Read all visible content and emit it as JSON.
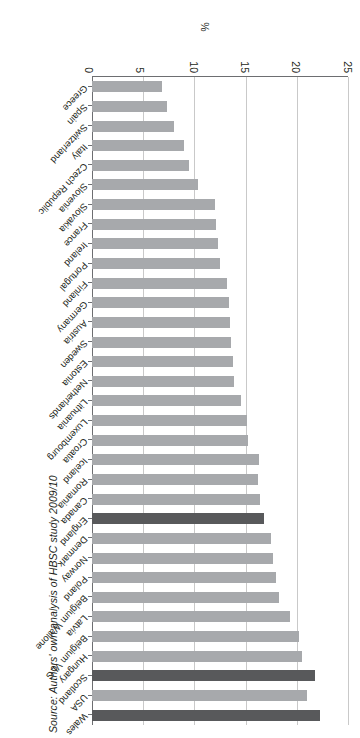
{
  "figure": {
    "source_note": "Source: Authors' own analysis of HBSC study 2009/10",
    "axis_title": "%",
    "rotated_180": true
  },
  "chart_data": {
    "type": "bar",
    "orientation": "horizontal",
    "title": "",
    "xlabel": "%",
    "ylabel": "",
    "xlim": [
      0,
      25
    ],
    "xticks": [
      0,
      5,
      10,
      15,
      20,
      25
    ],
    "grid": true,
    "legend": [],
    "highlight_color": "#58595b",
    "bar_color": "#a7a9ac",
    "categories": [
      "Wales",
      "USA",
      "Scotland",
      "Hungary",
      "Belgium VLG",
      "Latvia",
      "Belgium Wallone",
      "Poland",
      "Norway",
      "Denmark",
      "England",
      "Canada",
      "Romania",
      "Iceland",
      "Croatia",
      "Luxembourg",
      "Lithuania",
      "Netherlands",
      "Estonia",
      "Sweden",
      "Austria",
      "Germany",
      "Finland",
      "Portugal",
      "Ireland",
      "France",
      "Slovakia",
      "Slovenia",
      "Czech Republic",
      "Italy",
      "Switzerland",
      "Spain",
      "Greece"
    ],
    "values": [
      22.3,
      21.0,
      21.8,
      20.5,
      20.2,
      19.3,
      18.3,
      18.0,
      17.7,
      17.5,
      16.8,
      16.4,
      16.2,
      16.3,
      15.2,
      15.1,
      14.6,
      13.9,
      13.8,
      13.6,
      13.5,
      13.4,
      13.2,
      12.5,
      12.3,
      12.1,
      12.0,
      10.4,
      9.5,
      9.0,
      8.0,
      7.3,
      6.8
    ],
    "highlighted": [
      "Wales",
      "Scotland",
      "England"
    ]
  }
}
